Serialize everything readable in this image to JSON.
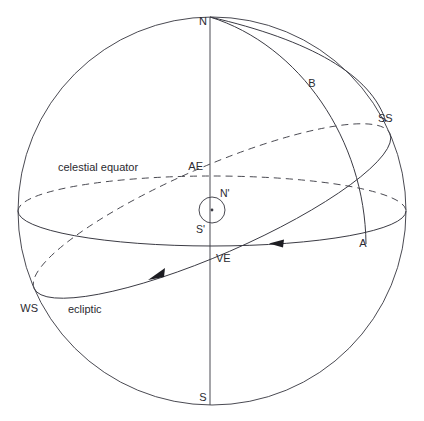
{
  "figure": {
    "type": "celestial-sphere-diagram",
    "background_color": "#ffffff",
    "line_color": "#4a4a52",
    "text_color": "#2a2a30",
    "width": 424,
    "height": 421
  },
  "geometry": {
    "sphere": {
      "cx": 212,
      "cy": 211,
      "r": 194
    },
    "celestial_equator": {
      "cx": 212,
      "cy": 211,
      "rx": 194,
      "ry": 35,
      "rotation_deg": 0
    },
    "ecliptic": {
      "cx": 212,
      "cy": 211,
      "rx": 194,
      "ry": 44,
      "rotation_deg": -23.5
    },
    "polar_axis": {
      "x1": 210,
      "y1": 17,
      "x2": 210,
      "y2": 405
    },
    "sun_marker": {
      "cx": 212,
      "cy": 210,
      "r": 13
    }
  },
  "labels": {
    "north_pole": {
      "text": "N",
      "x": 208,
      "y": 22
    },
    "south_pole": {
      "text": "S",
      "x": 207,
      "y": 398
    },
    "vernal_equinox": {
      "text": "VE",
      "x": 222,
      "y": 258
    },
    "autumnal_equinox": {
      "text": "AE",
      "x": 196,
      "y": 167
    },
    "summer_solstice": {
      "text": "SS",
      "x": 382,
      "y": 119
    },
    "winter_solstice": {
      "text": "WS",
      "x": 28,
      "y": 309
    },
    "point_a": {
      "text": "A",
      "x": 364,
      "y": 244
    },
    "point_b": {
      "text": "B",
      "x": 312,
      "y": 84
    },
    "zenith_prime": {
      "text": "N'",
      "x": 223,
      "y": 195
    },
    "nadir_prime": {
      "text": "S'",
      "x": 203,
      "y": 229
    },
    "celestial_equator": {
      "text": "celestial equator",
      "x": 60,
      "y": 168
    },
    "ecliptic": {
      "text": "ecliptic",
      "x": 70,
      "y": 310
    }
  },
  "arrows": [
    {
      "name": "equator-direction-arrow",
      "x": 277,
      "y": 243,
      "direction": "left"
    },
    {
      "name": "ecliptic-direction-arrow",
      "x": 157,
      "y": 274,
      "direction": "down-left"
    }
  ]
}
